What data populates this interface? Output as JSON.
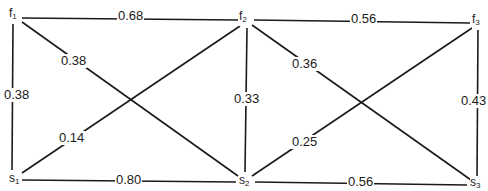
{
  "nodes": {
    "f1": {
      "base": "f",
      "sub": "1"
    },
    "f2": {
      "base": "f",
      "sub": "2"
    },
    "f3": {
      "base": "f",
      "sub": "3"
    },
    "s1": {
      "base": "s",
      "sub": "1"
    },
    "s2": {
      "base": "s",
      "sub": "2"
    },
    "s3": {
      "base": "s",
      "sub": "3"
    }
  },
  "edges": {
    "f1_f2": {
      "from": "f1",
      "to": "f2",
      "weight": "0.68"
    },
    "f2_f3": {
      "from": "f2",
      "to": "f3",
      "weight": "0.56"
    },
    "f1_s1": {
      "from": "f1",
      "to": "s1",
      "weight": "0.38"
    },
    "f1_s2": {
      "from": "f1",
      "to": "s2",
      "weight": "0.38"
    },
    "s1_f2": {
      "from": "s1",
      "to": "f2",
      "weight": "0.14"
    },
    "f2_s2": {
      "from": "f2",
      "to": "s2",
      "weight": "0.33"
    },
    "f2_s3": {
      "from": "f2",
      "to": "s3",
      "weight": "0.36"
    },
    "s2_f3": {
      "from": "s2",
      "to": "f3",
      "weight": "0.25"
    },
    "f3_s3": {
      "from": "f3",
      "to": "s3",
      "weight": "0.43"
    },
    "s1_s2": {
      "from": "s1",
      "to": "s2",
      "weight": "0.80"
    },
    "s2_s3": {
      "from": "s2",
      "to": "s3",
      "weight": "0.56"
    }
  },
  "colors": {
    "line": "#1a1a1a",
    "background": "#ffffff"
  }
}
